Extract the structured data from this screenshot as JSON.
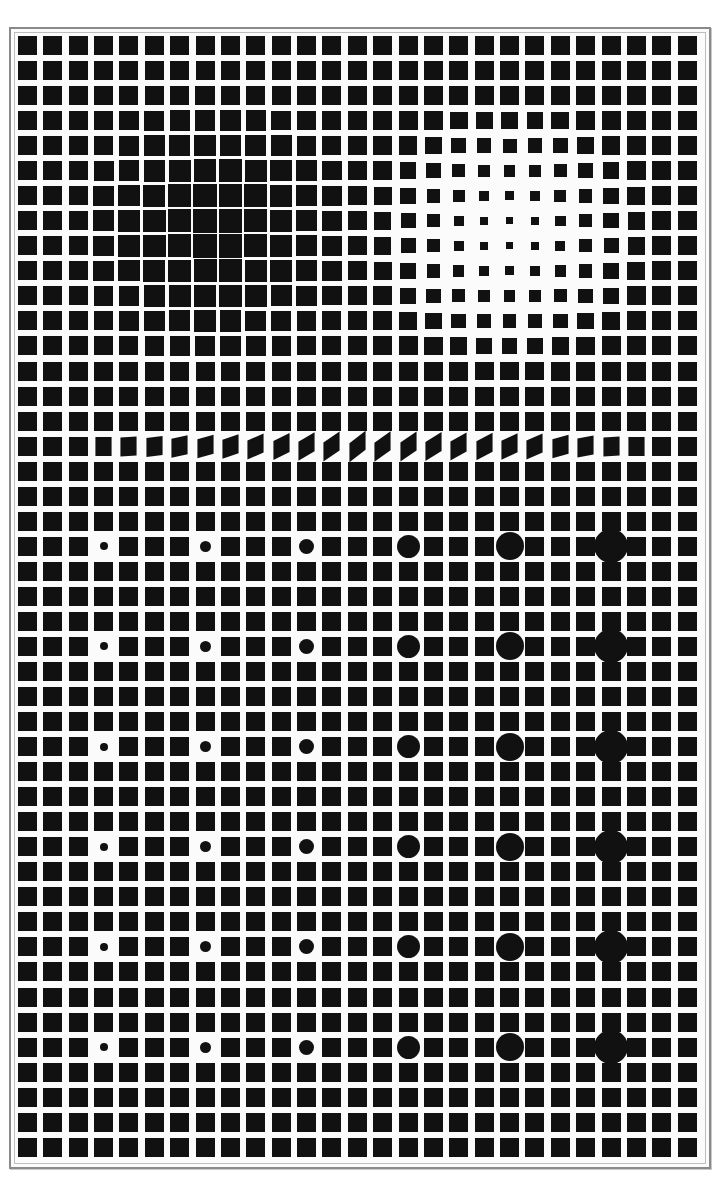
{
  "artwork": {
    "type": "op-art grid",
    "colors": {
      "ink": "#111111",
      "paper": "#fbfbfb",
      "frame": "#8a8a8a"
    },
    "grid": {
      "columns": 27,
      "rows": 45,
      "origin_x": 18,
      "origin_y": 36,
      "pitch_x": 25.37,
      "pitch_y": 25.04,
      "base_square": 19
    },
    "dark_bulge": {
      "center_col": 7.3,
      "center_row": 7.3,
      "radius": 5.5,
      "max_square": 24.5
    },
    "light_bulge": {
      "center_col": 19,
      "center_row": 7.6,
      "radius": 5.5,
      "min_square": 6
    },
    "skew_row": {
      "row": 16,
      "start_col": 3,
      "end_col": 24,
      "peak_col": 13,
      "max_skew_deg": 38
    },
    "dots": {
      "columns": [
        3,
        7,
        11,
        15,
        19,
        23
      ],
      "rows": [
        20,
        24,
        28,
        32,
        36,
        40
      ],
      "diameters": [
        8,
        11,
        15,
        23,
        28,
        34
      ]
    }
  }
}
